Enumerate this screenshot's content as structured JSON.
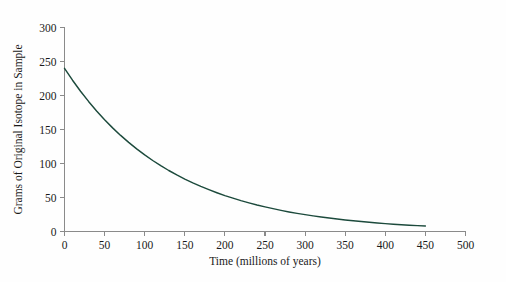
{
  "chart_data": {
    "type": "line",
    "title": "",
    "subtitle": "",
    "xlabel": "Time (millions of years)",
    "ylabel": "Grams of Original Isotope in Sample",
    "xlim": [
      0,
      500
    ],
    "ylim": [
      0,
      300
    ],
    "xticks": [
      0,
      50,
      100,
      150,
      200,
      250,
      300,
      350,
      400,
      450,
      500
    ],
    "xtick_labels": [
      "0",
      "50",
      "100",
      "150",
      "200",
      "250",
      "300",
      "350",
      "400",
      "450",
      "500"
    ],
    "yticks": [
      0,
      50,
      100,
      150,
      200,
      250,
      300
    ],
    "ytick_labels": [
      "0",
      "50",
      "100",
      "150",
      "200",
      "250",
      "300"
    ],
    "grid": false,
    "legend": null,
    "legend_position": "none",
    "series": [
      {
        "name": "Original isotope remaining",
        "color": "#1c4a3c",
        "x": [
          0,
          10,
          20,
          30,
          40,
          50,
          60,
          70,
          80,
          90,
          100,
          110,
          120,
          130,
          140,
          150,
          160,
          170,
          180,
          190,
          200,
          210,
          220,
          230,
          240,
          250,
          260,
          270,
          280,
          290,
          300,
          310,
          320,
          330,
          340,
          350,
          360,
          370,
          380,
          390,
          400,
          410,
          420,
          430,
          440,
          450
        ],
        "values": [
          240.0,
          222.5,
          206.3,
          191.3,
          177.3,
          164.4,
          152.4,
          141.3,
          131.0,
          121.5,
          112.6,
          104.4,
          96.8,
          89.7,
          83.2,
          77.1,
          71.5,
          66.3,
          61.5,
          57.0,
          52.8,
          49.0,
          45.4,
          42.1,
          39.0,
          36.2,
          33.6,
          31.1,
          28.8,
          26.7,
          24.8,
          23.0,
          21.3,
          19.8,
          18.3,
          17.0,
          15.8,
          14.6,
          13.5,
          12.6,
          11.6,
          10.8,
          10.0,
          9.3,
          8.6,
          8.0
        ]
      }
    ],
    "annotations": []
  },
  "axes": {
    "x_title": "Time (millions of years)",
    "y_title": "Grams of Original Isotope in Sample",
    "axis_color": "#8a8a8a",
    "tick_text_color": "#1a1a1a"
  },
  "figure": {
    "background_color": "#fefefe",
    "curve_color": "#1c4a3c"
  }
}
